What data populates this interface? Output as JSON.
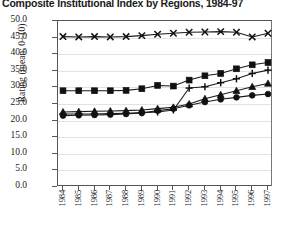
{
  "title": "Composite Institutional Index by Regions, 1984-97",
  "axes": {
    "ylabel": "Rating (mean: 0–10)",
    "yticks": [
      "50.0",
      "45.0",
      "40.0",
      "35.0",
      "30.0",
      "25.0",
      "20.0",
      "15.0",
      "10.0",
      "5.0",
      "0.0"
    ],
    "ylim": [
      0,
      50
    ],
    "xlabel": "",
    "xticks": [
      "1984",
      "1985",
      "1986",
      "1987",
      "1988",
      "1989",
      "1990",
      "1991",
      "1992",
      "1993",
      "1994",
      "1995",
      "1996",
      "1997"
    ]
  },
  "chart_data": {
    "type": "line",
    "title": "Composite Institutional Index by Regions, 1984-97",
    "xlabel": "",
    "ylabel": "Rating (mean: 0–10)",
    "ylim": [
      0,
      50
    ],
    "grid": true,
    "legend": "none",
    "x": [
      "1984",
      "1985",
      "1986",
      "1987",
      "1988",
      "1989",
      "1990",
      "1991",
      "1992",
      "1993",
      "1994",
      "1995",
      "1996",
      "1997"
    ],
    "series": [
      {
        "name": "series-cross",
        "marker": "x",
        "values": [
          45.3,
          45.2,
          45.3,
          45.2,
          45.3,
          45.6,
          46.0,
          46.3,
          46.6,
          46.7,
          46.8,
          46.6,
          45.2,
          46.3
        ]
      },
      {
        "name": "series-square",
        "marker": "square",
        "values": [
          29.0,
          29.0,
          29.0,
          29.0,
          29.1,
          29.6,
          30.6,
          30.4,
          32.2,
          33.5,
          34.2,
          35.6,
          36.8,
          37.5
        ]
      },
      {
        "name": "series-plus",
        "marker": "plus",
        "values": [
          22.0,
          22.0,
          22.0,
          22.1,
          22.2,
          22.4,
          22.6,
          23.2,
          29.8,
          30.2,
          31.4,
          32.6,
          34.2,
          35.2
        ]
      },
      {
        "name": "series-triangle",
        "marker": "triangle",
        "values": [
          22.6,
          22.7,
          22.8,
          22.9,
          23.0,
          23.2,
          23.6,
          24.0,
          25.0,
          26.6,
          27.8,
          29.0,
          30.2,
          31.2
        ]
      },
      {
        "name": "series-circle",
        "marker": "circle",
        "values": [
          21.5,
          21.6,
          21.7,
          21.8,
          22.0,
          22.3,
          23.0,
          23.6,
          24.6,
          25.6,
          26.4,
          27.0,
          27.6,
          28.0
        ]
      }
    ]
  }
}
